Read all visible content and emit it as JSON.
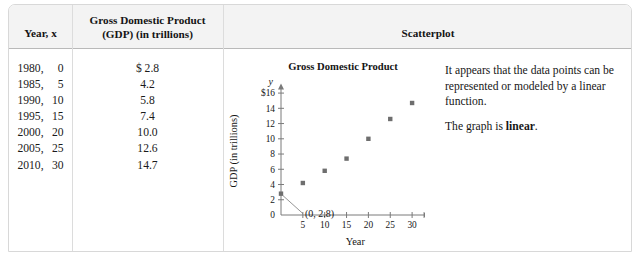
{
  "table": {
    "headers": {
      "year": "Year, x",
      "gdp_line1": "Gross Domestic Product",
      "gdp_line2": "(GDP) (in trillions)",
      "scatterplot": "Scatterplot"
    },
    "rows": [
      {
        "year": "1980,",
        "x": "0",
        "gdp": "$ 2.8"
      },
      {
        "year": "1985,",
        "x": "5",
        "gdp": "4.2"
      },
      {
        "year": "1990,",
        "x": "10",
        "gdp": "5.8"
      },
      {
        "year": "1995,",
        "x": "15",
        "gdp": "7.4"
      },
      {
        "year": "2000,",
        "x": "20",
        "gdp": "10.0"
      },
      {
        "year": "2005,",
        "x": "25",
        "gdp": "12.6"
      },
      {
        "year": "2010,",
        "x": "30",
        "gdp": "14.7"
      }
    ]
  },
  "explanation": {
    "line1": "It appears that the data points can be represented or modeled by a linear function.",
    "line2_prefix": "The graph is ",
    "line2_bold": "linear",
    "line2_suffix": "."
  },
  "colors": {
    "marker": "#6e6e6e",
    "axis": "#7a7a7a",
    "header_bg": "#f3f3f3",
    "border": "#d8d8d8",
    "rule": "#b9b9b9",
    "text": "#161616"
  },
  "chart_data": {
    "type": "scatter",
    "title": "Gross Domestic Product",
    "xlabel": "Year",
    "ylabel": "GDP (in trillions)",
    "x_axis_symbol": "x",
    "y_axis_symbol": "y",
    "x": [
      0,
      5,
      10,
      15,
      20,
      25,
      30
    ],
    "values": [
      2.8,
      4.2,
      5.8,
      7.4,
      10.0,
      12.6,
      14.7
    ],
    "xlim": [
      0,
      34
    ],
    "ylim": [
      0,
      17
    ],
    "xticks": [
      5,
      10,
      15,
      20,
      25,
      30
    ],
    "xtick_labels": [
      "5",
      "10",
      "15",
      "20",
      "25",
      "30"
    ],
    "yticks": [
      2,
      4,
      6,
      8,
      10,
      12,
      14,
      16
    ],
    "ytick_labels": [
      "2",
      "4",
      "6",
      "8",
      "10",
      "12",
      "14",
      "$16"
    ],
    "grid": false,
    "legend": "none",
    "annotations": [
      {
        "text": "(0, 2.8)",
        "point_x": 0,
        "point_y": 2.8
      }
    ]
  }
}
